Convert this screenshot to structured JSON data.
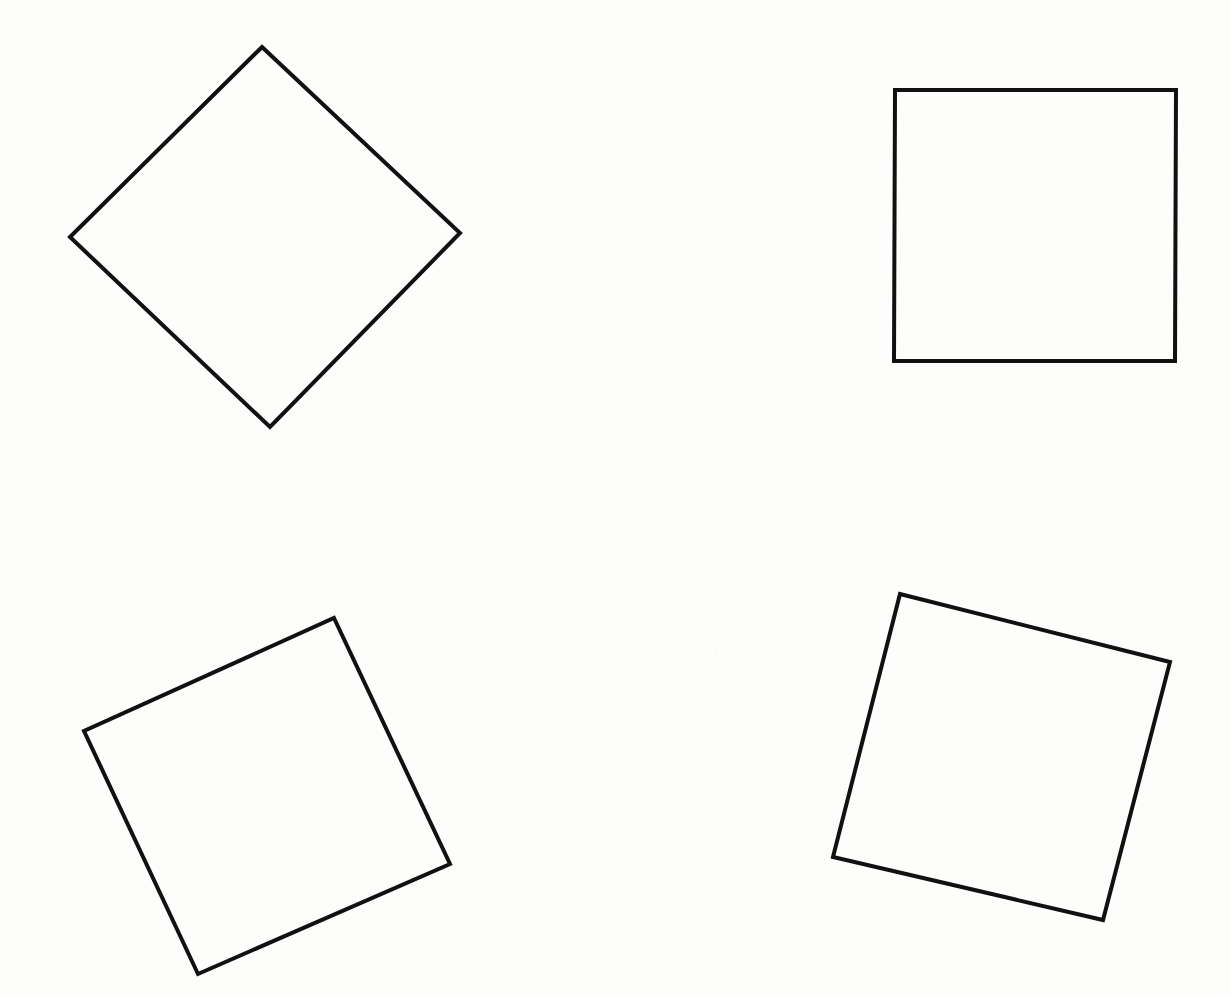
{
  "page": {
    "width": 1231,
    "height": 995,
    "background_color": "#fdfdfc",
    "medium": "scanned-line-drawing"
  },
  "style": {
    "stroke_color": "#111111",
    "fill_color": "none",
    "stroke_width": 4
  },
  "chart_data": {
    "type": "diagram",
    "subtitle": "",
    "xlabel": "",
    "ylabel": "",
    "grid": false,
    "legend": "none",
    "xlim": [
      0,
      1231
    ],
    "ylim": [
      0,
      995
    ],
    "note": "Each shape is a square outline drawn in black ink on white paper; vertices are given in image pixel coordinates with origin at the top-left.",
    "shapes": [
      {
        "id": "square-1",
        "name": "top-left-diamond",
        "type": "square",
        "position": "top-left",
        "rotation_deg": 45,
        "side_length": 272,
        "center": [
          265,
          236
        ],
        "vertices": [
          [
            262,
            47
          ],
          [
            460,
            233
          ],
          [
            270,
            427
          ],
          [
            70,
            237
          ]
        ],
        "vertex_labels": [
          "top",
          "right",
          "bottom",
          "left"
        ],
        "stroke_color": "#111111",
        "fill": "none",
        "stroke_width": 4
      },
      {
        "id": "square-2",
        "name": "top-right-upright",
        "type": "square",
        "position": "top-right",
        "rotation_deg": 0,
        "side_length": 275,
        "center": [
          1035,
          226
        ],
        "vertices": [
          [
            895,
            90
          ],
          [
            1176,
            90
          ],
          [
            1175,
            361
          ],
          [
            894,
            361
          ]
        ],
        "vertex_labels": [
          "top-left",
          "top-right",
          "bottom-right",
          "bottom-left"
        ],
        "stroke_color": "#111111",
        "fill": "none",
        "stroke_width": 4
      },
      {
        "id": "square-3",
        "name": "bottom-left-tilted",
        "type": "square",
        "position": "bottom-left",
        "rotation_deg": -25,
        "side_length": 272,
        "center": [
          267,
          797
        ],
        "vertices": [
          [
            334,
            618
          ],
          [
            450,
            864
          ],
          [
            198,
            974
          ],
          [
            84,
            731
          ]
        ],
        "vertex_labels": [
          "top",
          "right",
          "bottom",
          "left"
        ],
        "stroke_color": "#111111",
        "fill": "none",
        "stroke_width": 4
      },
      {
        "id": "square-4",
        "name": "bottom-right-tilted",
        "type": "square",
        "position": "bottom-right",
        "rotation_deg": -14,
        "side_length": 278,
        "center": [
          1002,
          758
        ],
        "vertices": [
          [
            900,
            594
          ],
          [
            1170,
            662
          ],
          [
            1103,
            920
          ],
          [
            833,
            857
          ]
        ],
        "vertex_labels": [
          "top-left",
          "top-right",
          "bottom-right",
          "bottom-left"
        ],
        "stroke_color": "#111111",
        "fill": "none",
        "stroke_width": 4
      }
    ]
  }
}
